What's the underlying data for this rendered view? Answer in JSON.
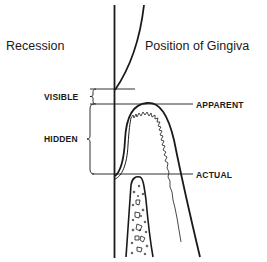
{
  "diagram": {
    "heading_left": "Recession",
    "heading_right": "Position of Gingiva",
    "recession_labels": {
      "visible": "VISIBLE",
      "hidden": "HIDDEN"
    },
    "gingiva_labels": {
      "apparent": "APPARENT",
      "actual": "ACTUAL"
    },
    "colors": {
      "ink": "#1a1a1a",
      "background": "#ffffff"
    }
  }
}
